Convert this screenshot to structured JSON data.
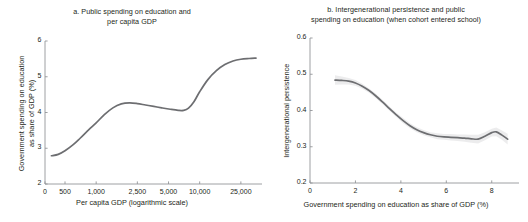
{
  "figure": {
    "background": "#ffffff",
    "line_color": "#6d6e71",
    "band_color": "#e9e9ea",
    "axis_color": "#939598",
    "text_color": "#231f20"
  },
  "panels": [
    {
      "id": "a",
      "title": "a. Public spending on education and\nper capita GDP",
      "chart_data": {
        "type": "line",
        "title": "a. Public spending on education and per capita GDP",
        "xlabel": "Per capita GDP (logarithmic scale)",
        "ylabel": "Government spending on education\nas share of GDP (%)",
        "xscale": "log",
        "grid": false,
        "legend": "none",
        "xlim": [
          0,
          40000
        ],
        "ylim": [
          2,
          6
        ],
        "xticks": [
          0,
          500,
          1000,
          2500,
          5000,
          10000,
          25000
        ],
        "xticklabels": [
          "0",
          "500",
          "1,000",
          "2,500",
          "5,000",
          "10,000",
          "25,000"
        ],
        "yticks": [
          2,
          3,
          4,
          5,
          6
        ],
        "yticklabels": [
          "2",
          "3",
          "4",
          "5",
          "6"
        ],
        "series": [
          {
            "name": "Government spending on education as share of GDP (%)",
            "x": [
              370,
              430,
              500,
              600,
              700,
              850,
              1000,
              1200,
              1450,
              1750,
              2100,
              2500,
              3000,
              3600,
              4300,
              5200,
              6200,
              7000,
              7800,
              8800,
              10000,
              12000,
              14500,
              17500,
              21000,
              25000,
              30000,
              35000
            ],
            "y": [
              2.79,
              2.83,
              2.93,
              3.1,
              3.28,
              3.52,
              3.71,
              3.94,
              4.13,
              4.24,
              4.27,
              4.25,
              4.21,
              4.17,
              4.13,
              4.09,
              4.06,
              4.06,
              4.12,
              4.3,
              4.58,
              4.92,
              5.17,
              5.34,
              5.44,
              5.49,
              5.51,
              5.52
            ]
          }
        ]
      }
    },
    {
      "id": "b",
      "title": "b. Intergenerational persistence and public\nspending on education (when cohort entered school)",
      "chart_data": {
        "type": "line",
        "title": "b. Intergenerational persistence and public spending on education (when cohort entered school)",
        "xlabel": "Government spending on education as share of GDP (%)",
        "ylabel": "Intergenerational persistence",
        "xscale": "linear",
        "grid": false,
        "legend": "none",
        "xlim": [
          0,
          9.2
        ],
        "ylim": [
          0.2,
          0.6
        ],
        "xticks": [
          0,
          2,
          4,
          6,
          8
        ],
        "xticklabels": [
          "0",
          "2",
          "4",
          "6",
          "8"
        ],
        "yticks": [
          0.2,
          0.3,
          0.4,
          0.5,
          0.6
        ],
        "yticklabels": [
          "0.2",
          "0.3",
          "0.4",
          "0.5",
          "0.6"
        ],
        "series": [
          {
            "name": "Intergenerational persistence",
            "x": [
              1.1,
              1.4,
              1.7,
              2.0,
              2.3,
              2.6,
              2.9,
              3.2,
              3.5,
              3.8,
              4.1,
              4.4,
              4.7,
              5.0,
              5.3,
              5.6,
              5.9,
              6.2,
              6.5,
              6.8,
              7.1,
              7.4,
              7.7,
              8.0,
              8.2,
              8.45,
              8.7
            ],
            "y": [
              0.484,
              0.483,
              0.481,
              0.476,
              0.467,
              0.455,
              0.44,
              0.423,
              0.405,
              0.388,
              0.372,
              0.358,
              0.347,
              0.339,
              0.333,
              0.329,
              0.327,
              0.326,
              0.325,
              0.324,
              0.322,
              0.321,
              0.329,
              0.339,
              0.341,
              0.332,
              0.321
            ],
            "band_upper": [
              0.497,
              0.494,
              0.49,
              0.484,
              0.474,
              0.461,
              0.446,
              0.429,
              0.411,
              0.394,
              0.379,
              0.365,
              0.354,
              0.346,
              0.34,
              0.337,
              0.335,
              0.335,
              0.334,
              0.334,
              0.333,
              0.333,
              0.34,
              0.35,
              0.353,
              0.345,
              0.336
            ],
            "band_lower": [
              0.471,
              0.472,
              0.472,
              0.468,
              0.46,
              0.449,
              0.434,
              0.417,
              0.399,
              0.382,
              0.365,
              0.351,
              0.34,
              0.332,
              0.326,
              0.321,
              0.319,
              0.317,
              0.316,
              0.314,
              0.311,
              0.309,
              0.318,
              0.328,
              0.329,
              0.319,
              0.306
            ]
          }
        ]
      }
    }
  ]
}
